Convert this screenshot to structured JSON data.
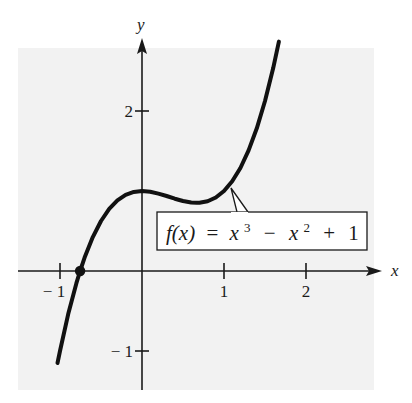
{
  "chart_data": {
    "type": "line",
    "title": "",
    "function_label": "f(x) = x³ − x² + 1",
    "function_label_parts": {
      "lhs": "f(x)",
      "eq": "=",
      "t1": "x",
      "t1_exp": "3",
      "op1": "−",
      "t2": "x",
      "t2_exp": "2",
      "op2": "+",
      "t3": "1"
    },
    "xlabel": "x",
    "ylabel": "y",
    "x_ticks": [
      {
        "value": -1,
        "label": "− 1"
      },
      {
        "value": 1,
        "label": "1"
      },
      {
        "value": 2,
        "label": "2"
      }
    ],
    "y_ticks": [
      {
        "value": 2,
        "label": "2"
      },
      {
        "value": -1,
        "label": "− 1"
      }
    ],
    "xlim": [
      -1.5,
      2.85
    ],
    "ylim": [
      -1.5,
      2.8
    ],
    "grid": false,
    "legend": "callout box pointing to curve near x ≈ 1.1",
    "highlighted_point": {
      "x": -0.755,
      "y": 0,
      "label": "real root"
    },
    "series": [
      {
        "name": "f(x) = x^3 - x^2 + 1",
        "x": [
          -1.03,
          -1.0,
          -0.9,
          -0.8,
          -0.755,
          -0.7,
          -0.6,
          -0.5,
          -0.4,
          -0.3,
          -0.2,
          -0.1,
          0.0,
          0.1,
          0.2,
          0.3,
          0.4,
          0.5,
          0.6,
          0.667,
          0.7,
          0.8,
          0.9,
          1.0,
          1.1,
          1.2,
          1.3,
          1.4,
          1.5,
          1.6,
          1.67
        ],
        "values": [
          -1.15,
          -1.0,
          -0.539,
          -0.152,
          0.0,
          0.167,
          0.424,
          0.625,
          0.776,
          0.883,
          0.952,
          0.989,
          1.0,
          0.991,
          0.968,
          0.937,
          0.904,
          0.875,
          0.856,
          0.852,
          0.853,
          0.872,
          0.919,
          1.0,
          1.121,
          1.288,
          1.507,
          1.784,
          2.125,
          2.536,
          2.867
        ]
      }
    ],
    "colors": {
      "panel": "#f2f2f2",
      "curve": "#111111",
      "axes": "#1a1a1a",
      "callout_fill": "#ffffff"
    }
  }
}
